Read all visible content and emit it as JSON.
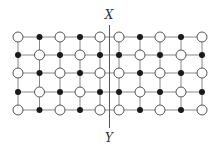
{
  "diagram": {
    "title": "",
    "labels": {
      "top": "X",
      "bottom": "Y"
    },
    "colors": {
      "line": "#888888",
      "divider": "#555555",
      "open_fill": "#ffffff",
      "open_stroke": "#555555",
      "filled": "#1a1a1a",
      "text": "#333333"
    },
    "grid": {
      "columns_x": [
        18,
        39.5,
        60,
        80,
        100,
        119,
        140,
        160,
        181,
        202
      ],
      "rows_y": [
        37,
        55,
        73,
        92,
        110
      ],
      "divider_x": 109.5,
      "divider_y_range": [
        25,
        128
      ]
    },
    "nodes": [
      [
        "open",
        "filled",
        "open",
        "filled",
        "open",
        "open",
        "filled",
        "open",
        "filled",
        "open"
      ],
      [
        "filled",
        "open",
        "filled",
        "open",
        "filled",
        "filled",
        "open",
        "filled",
        "open",
        "filled"
      ],
      [
        "open",
        "filled",
        "open",
        "filled",
        "open",
        "open",
        "filled",
        "open",
        "filled",
        "open"
      ],
      [
        "filled",
        "open",
        "filled",
        "open",
        "filled",
        "filled",
        "open",
        "filled",
        "open",
        "filled"
      ],
      [
        "open",
        "filled",
        "open",
        "filled",
        "open",
        "open",
        "filled",
        "open",
        "filled",
        "open"
      ]
    ]
  }
}
